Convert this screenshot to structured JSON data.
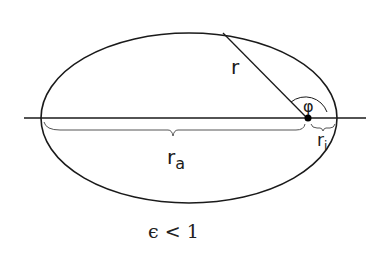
{
  "diagram": {
    "labels": {
      "radius": "r",
      "angle": "φ",
      "aphelion": "r",
      "aphelion_sub": "a",
      "perihelion": "r",
      "perihelion_sub": "i",
      "condition": "ϵ < 1"
    },
    "colors": {
      "stroke": "#1a1a1a",
      "brace": "#555555",
      "background": "#ffffff"
    }
  }
}
